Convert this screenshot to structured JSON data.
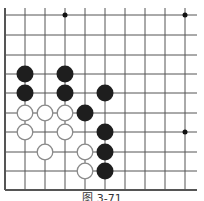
{
  "diagram": {
    "type": "go-board-partial",
    "caption": "图 3-71",
    "colors": {
      "line": "#555555",
      "black_stone": "#1e1e1e",
      "white_stone_fill": "#ffffff",
      "white_stone_stroke": "#8a8a8a",
      "star": "#111111"
    },
    "grid": {
      "x": [
        5,
        25,
        45,
        65,
        85,
        105,
        125,
        145,
        165,
        185
      ],
      "y": [
        15,
        35,
        55,
        74,
        93,
        113,
        132,
        152,
        171,
        190
      ],
      "right_extent": 197,
      "top_extent": 8,
      "left_edge": true,
      "bottom_edge": true
    },
    "star_points": [
      {
        "col": 3,
        "row": 0
      },
      {
        "col": 9,
        "row": 0
      },
      {
        "col": 9,
        "row": 6
      }
    ],
    "stones": [
      {
        "color": "black",
        "col": 1,
        "row": 3
      },
      {
        "color": "black",
        "col": 3,
        "row": 3
      },
      {
        "color": "black",
        "col": 1,
        "row": 4
      },
      {
        "color": "black",
        "col": 3,
        "row": 4
      },
      {
        "color": "black",
        "col": 5,
        "row": 4
      },
      {
        "color": "black",
        "col": 4,
        "row": 5
      },
      {
        "color": "black",
        "col": 5,
        "row": 6
      },
      {
        "color": "black",
        "col": 5,
        "row": 7
      },
      {
        "color": "black",
        "col": 5,
        "row": 8
      },
      {
        "color": "white",
        "col": 1,
        "row": 5
      },
      {
        "color": "white",
        "col": 2,
        "row": 5
      },
      {
        "color": "white",
        "col": 3,
        "row": 5
      },
      {
        "color": "white",
        "col": 1,
        "row": 6
      },
      {
        "color": "white",
        "col": 3,
        "row": 6
      },
      {
        "color": "white",
        "col": 2,
        "row": 7
      },
      {
        "color": "white",
        "col": 4,
        "row": 7
      },
      {
        "color": "white",
        "col": 4,
        "row": 8
      }
    ]
  }
}
